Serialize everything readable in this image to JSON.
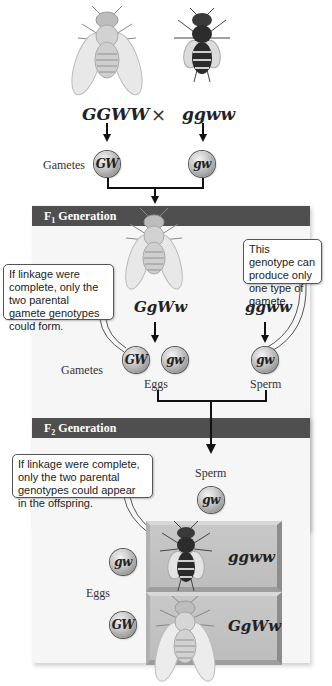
{
  "parental_cross": {
    "parent1": {
      "genotype": "GGWW",
      "phenotype": "gray body, normal wings"
    },
    "cross_symbol": "×",
    "parent2": {
      "genotype": "ggww",
      "phenotype": "black body, vestigial wings"
    },
    "gametes_label": "Gametes",
    "gamete1": "GW",
    "gamete2": "gw"
  },
  "f1": {
    "header": "F",
    "header_sub": "1",
    "header_rest": " Generation",
    "left_genotype": "GgWw",
    "right_genotype": "ggww",
    "callout_left": "If linkage were complete, only the two parental gamete genotypes could form.",
    "callout_right": "This genotype can produce only one type of gamete.",
    "gametes_label": "Gametes",
    "eggs": [
      "GW",
      "gw"
    ],
    "eggs_label": "Eggs",
    "sperm": [
      "gw"
    ],
    "sperm_label": "Sperm"
  },
  "f2": {
    "header": "F",
    "header_sub": "2",
    "header_rest": " Generation",
    "callout": "If linkage were complete, only the two parental genotypes could appear in the offspring.",
    "sperm_label": "Sperm",
    "sperm": "gw",
    "eggs_label": "Eggs",
    "eggs": [
      "gw",
      "GW"
    ],
    "offspring": [
      {
        "egg": "gw",
        "genotype": "ggww"
      },
      {
        "egg": "GW",
        "genotype": "GgWw"
      }
    ]
  },
  "colors": {
    "header_bar": "#4f4f4f",
    "panel_bg": "#f6f6f6",
    "box_gray": "#c3c3c3"
  }
}
